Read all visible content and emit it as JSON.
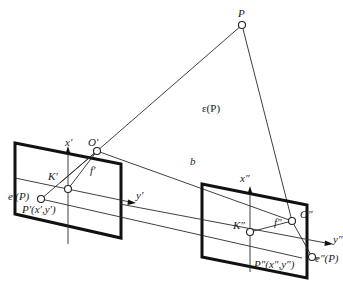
{
  "diagram": {
    "type": "epipolar-geometry",
    "background": "#ffffff",
    "points": {
      "P": {
        "label": "P",
        "x": 242,
        "y": 25
      },
      "O1": {
        "label": "O'",
        "x": 97,
        "y": 151
      },
      "O2": {
        "label": "O″",
        "x": 292,
        "y": 221
      },
      "K1": {
        "label": "K'",
        "x": 68,
        "y": 189
      },
      "K2": {
        "label": "K″",
        "x": 250,
        "y": 232
      },
      "P1": {
        "label": "P'(x',y')",
        "x": 41,
        "y": 199
      },
      "P2": {
        "label": "P″(x″,y″)",
        "x": 312,
        "y": 257
      }
    },
    "labels": {
      "plane": "ε(P)",
      "baseline": "b",
      "x1_axis": "x'",
      "y1_axis": "y'",
      "x2_axis": "x″",
      "y2_axis": "y″",
      "f1": "f'",
      "f2": "f″",
      "e1": "e'(P)",
      "e2": "e″(P)"
    }
  }
}
